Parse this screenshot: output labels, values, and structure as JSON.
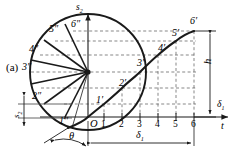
{
  "figure": {
    "caption": "(a)",
    "type": "cam-displacement-diagram",
    "axes": {
      "vertical_label": "s",
      "vertical_subscript": "2",
      "horizontal_label": "δ",
      "horizontal_subscript": "1",
      "horizontal_label_secondary": "t",
      "origin_label": "O"
    },
    "dimensions": {
      "rise_label": "h",
      "stroke_label": "s",
      "stroke_subscript": "2",
      "angle_span_label": "δ",
      "angle_span_subscript": "1",
      "angle_label": "θ"
    },
    "tick_labels": [
      "1",
      "2",
      "3",
      "4",
      "5",
      "6"
    ],
    "displacement_points": [
      {
        "label": "1′",
        "x": 103,
        "y": 101
      },
      {
        "label": "2′",
        "x": 127,
        "y": 83
      },
      {
        "label": "3′",
        "x": 143,
        "y": 63
      },
      {
        "label": "4′",
        "x": 166,
        "y": 47
      },
      {
        "label": "5′",
        "x": 180,
        "y": 34
      },
      {
        "label": "6′",
        "x": 196,
        "y": 24
      }
    ],
    "circle_points": [
      {
        "label": "1″",
        "x": 59,
        "y": 120
      },
      {
        "label": "2″",
        "x": 38,
        "y": 97
      },
      {
        "label": "3″",
        "x": 30,
        "y": 70
      },
      {
        "label": "4″",
        "x": 38,
        "y": 50
      },
      {
        "label": "5″",
        "x": 55,
        "y": 33
      },
      {
        "label": "6″",
        "x": 75,
        "y": 27
      }
    ],
    "colors": {
      "stroke": "#1a1a1a",
      "dashed": "#555555",
      "background": "#ffffff"
    }
  }
}
